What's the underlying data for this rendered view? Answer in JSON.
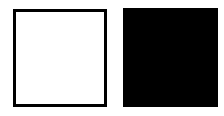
{
  "shapes": [
    {
      "kind": "square",
      "style": "outline",
      "fill": "#ffffff",
      "stroke": "#000000"
    },
    {
      "kind": "square",
      "style": "filled",
      "fill": "#000000"
    }
  ],
  "colors": {
    "background": "#ffffff",
    "outline": "#000000",
    "fill": "#000000"
  }
}
